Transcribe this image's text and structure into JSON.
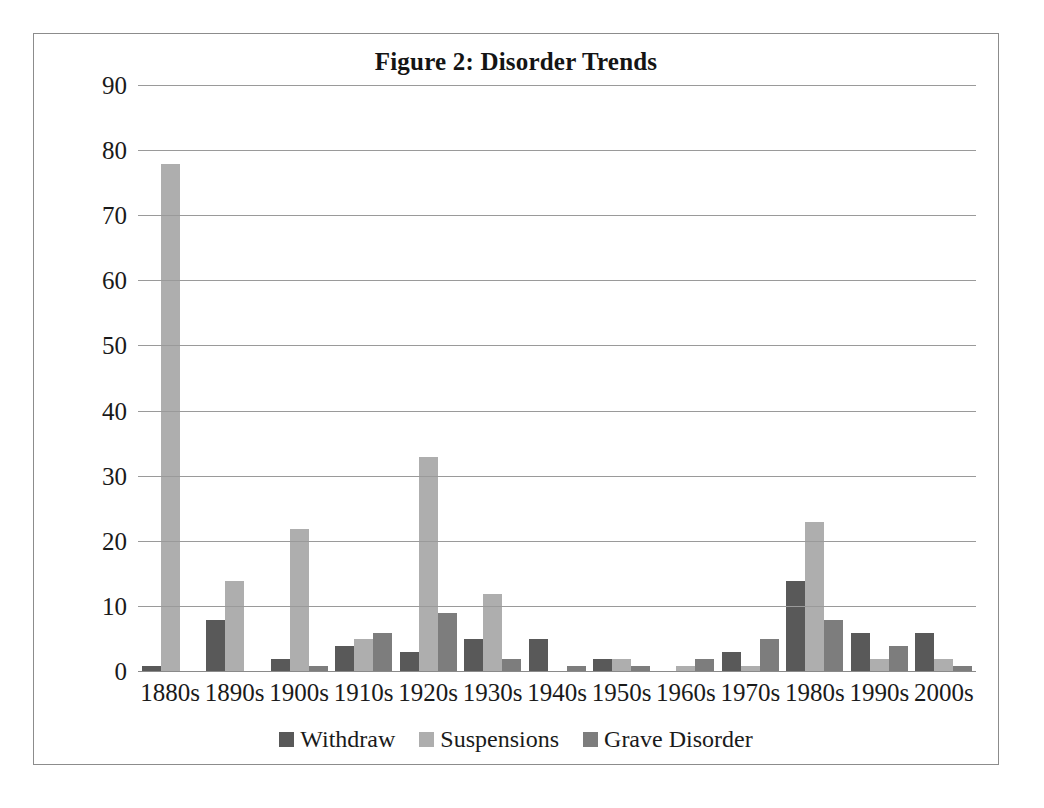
{
  "chart_data": {
    "type": "bar",
    "title": "Figure 2: Disorder Trends",
    "xlabel": "",
    "ylabel": "",
    "ylim": [
      0,
      90
    ],
    "ytick_step": 10,
    "yticks": [
      "90",
      "80",
      "70",
      "60",
      "50",
      "40",
      "30",
      "20",
      "10",
      "0"
    ],
    "grid": "horizontal",
    "legend_position": "bottom-center",
    "categories": [
      "1880s",
      "1890s",
      "1900s",
      "1910s",
      "1920s",
      "1930s",
      "1940s",
      "1950s",
      "1960s",
      "1970s",
      "1980s",
      "1990s",
      "2000s"
    ],
    "series": [
      {
        "name": "Withdraw",
        "color": "#595959",
        "values": [
          1,
          8,
          2,
          4,
          3,
          5,
          5,
          2,
          0,
          3,
          14,
          6,
          6
        ]
      },
      {
        "name": "Suspensions",
        "color": "#aeaeae",
        "values": [
          78,
          14,
          22,
          5,
          33,
          12,
          0,
          2,
          1,
          1,
          23,
          2,
          2
        ]
      },
      {
        "name": "Grave Disorder",
        "color": "#7d7d7d",
        "values": [
          0,
          0,
          1,
          6,
          9,
          2,
          1,
          1,
          2,
          5,
          8,
          4,
          1
        ]
      }
    ]
  },
  "figure": {
    "border_color": "#8c8c8c",
    "background": "#ffffff",
    "gridline_color": "#9a9a9a"
  }
}
